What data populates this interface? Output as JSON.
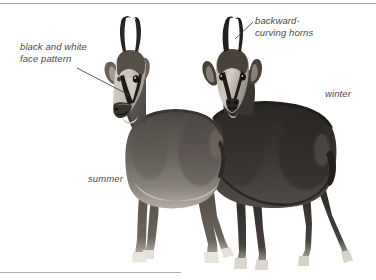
{
  "figure": {
    "type": "natural-history-illustration",
    "background_color": "#ffffff",
    "rules": {
      "top_rule_color": "#a9a9ad",
      "bottom_rule_color": "#b0b0b4"
    }
  },
  "labels": {
    "face_pattern": "black and white\nface pattern",
    "horns": "backward-\ncurving horns",
    "winter": "winter",
    "summer": "summer"
  },
  "label_style": {
    "color": "#4a4a4e",
    "style": "italic"
  },
  "animals": [
    {
      "id": "summer-chamois",
      "coat": "summer",
      "pose": "standing, body in profile facing left, head turned toward viewer",
      "coat_color": "#6c6863"
    },
    {
      "id": "winter-chamois",
      "coat": "winter",
      "pose": "standing behind, facing viewer, shaggy dark coat",
      "coat_color": "#3a3632"
    }
  ],
  "leader_lines": [
    {
      "name": "face-pattern-leader",
      "from_label": "face_pattern",
      "to": "summer-chamois-face"
    },
    {
      "name": "horns-leader",
      "from_label": "horns",
      "to": "winter-chamois-horn-tip"
    }
  ]
}
